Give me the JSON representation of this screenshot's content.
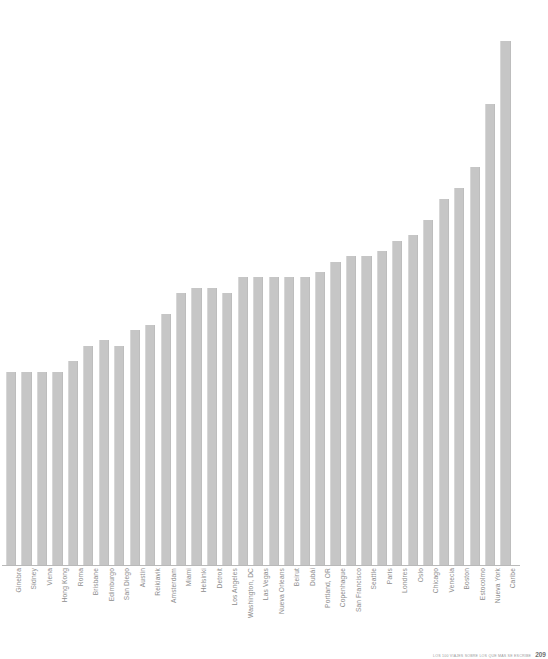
{
  "chart_data": {
    "type": "bar",
    "title": "",
    "subtitle": "",
    "xlabel": "",
    "ylabel": "",
    "grid": false,
    "legend": false,
    "orientation": "vertical",
    "bar_color": "#c6c6c6",
    "axis_color": "#b9b9b9",
    "label_color": "#8d8d8d",
    "label_rotation": -90,
    "ylim": [
      0,
      100
    ],
    "categories": [
      "Ginebra",
      "Sídney",
      "Viena",
      "Hong Kong",
      "Roma",
      "Brisbane",
      "Edimburgo",
      "San Diego",
      "Austin",
      "Reikiavik",
      "Amsterdam",
      "Miami",
      "Helsinki",
      "Detroit",
      "Los Angeles",
      "Washington, DC",
      "Las Vegas",
      "Nueva Orleans",
      "Beirut",
      "Dubái",
      "Portland, OR",
      "Copenhague",
      "San Francisco",
      "Seattle",
      "París",
      "Londres",
      "Oslo",
      "Chicago",
      "Venecia",
      "Boston",
      "Estocolmo",
      "Nueva York",
      "Caribe"
    ],
    "values": [
      37,
      37,
      37,
      37,
      39,
      42,
      43,
      42,
      45,
      46,
      48,
      52,
      53,
      53,
      52,
      55,
      55,
      55,
      55,
      55,
      56,
      58,
      59,
      59,
      60,
      62,
      63,
      66,
      70,
      72,
      76,
      88,
      100
    ]
  },
  "footer": {
    "caption": "LOS 100 VIAJES SOBRE LOS QUE MÁS SE ESCRIBE",
    "page": "209"
  }
}
